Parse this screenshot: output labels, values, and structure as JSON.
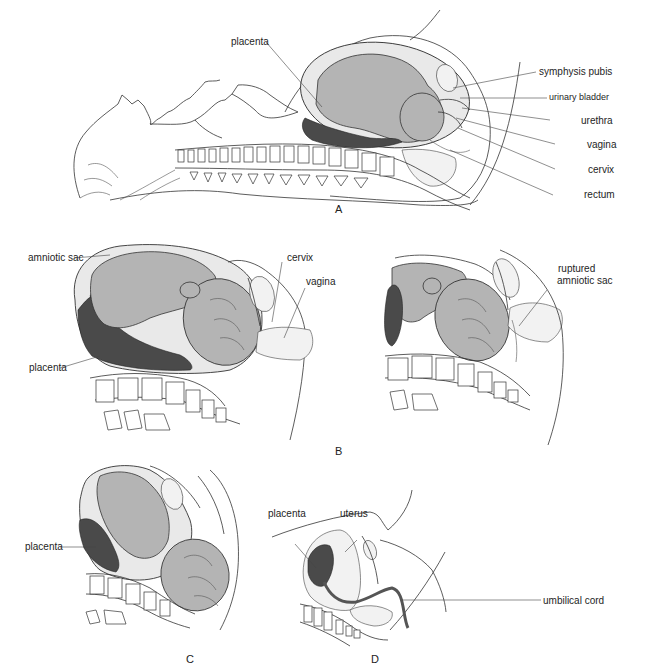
{
  "figure": {
    "panels": [
      {
        "id": "A",
        "letter": "A",
        "description": "Sagittal view of pregnant woman lying supine, fetus in uterus",
        "labels": [
          "placenta",
          "symphysis pubis",
          "urinary bladder",
          "urethra",
          "vagina",
          "cervix",
          "rectum"
        ]
      },
      {
        "id": "B",
        "letter": "B",
        "description": "Two views: intact amniotic sac with cervix and vagina; ruptured amniotic sac",
        "labels": [
          "amniotic sac",
          "cervix",
          "vagina",
          "placenta",
          "ruptured amniotic sac"
        ]
      },
      {
        "id": "C",
        "letter": "C",
        "description": "Fetal head descending through birth canal",
        "labels": [
          "placenta"
        ]
      },
      {
        "id": "D",
        "letter": "D",
        "description": "After delivery: placenta, uterus and umbilical cord",
        "labels": [
          "placenta",
          "uterus",
          "umbilical cord"
        ]
      }
    ]
  },
  "panelA": {
    "letter": "A",
    "placenta": "placenta",
    "symphysis_pubis": "symphysis pubis",
    "urinary_bladder": "urinary bladder",
    "urethra": "urethra",
    "vagina": "vagina",
    "cervix": "cervix",
    "rectum": "rectum"
  },
  "panelB": {
    "letter": "B",
    "amniotic_sac": "amniotic sac",
    "cervix": "cervix",
    "vagina": "vagina",
    "placenta": "placenta",
    "ruptured_line1": "ruptured",
    "ruptured_line2": "amniotic sac"
  },
  "panelC": {
    "letter": "C",
    "placenta": "placenta"
  },
  "panelD": {
    "letter": "D",
    "placenta": "placenta",
    "uterus": "uterus",
    "umbilical_cord": "umbilical cord"
  },
  "colors": {
    "fetus_fill": "#b4b4b4",
    "placenta_fill": "#4a4a4a",
    "line": "#333333",
    "background": "#ffffff"
  }
}
